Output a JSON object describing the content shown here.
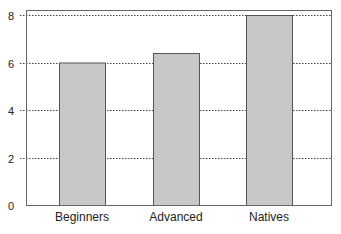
{
  "chart_data": {
    "type": "bar",
    "title": "",
    "xlabel": "",
    "ylabel": "",
    "categories": [
      "Beginners",
      "Advanced",
      "Natives"
    ],
    "values": [
      6.0,
      6.4,
      8.0
    ],
    "ylim": [
      0,
      8.2
    ],
    "yticks": [
      0,
      2,
      4,
      6,
      8
    ],
    "grid": "horizontal dotted",
    "legend": "none",
    "colors": {
      "bar_fill": "#c8c8c8",
      "bar_edge": "#555555",
      "grid": "#444444",
      "axis": "#555555"
    }
  }
}
